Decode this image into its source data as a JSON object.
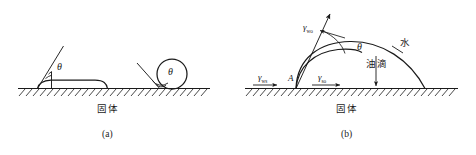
{
  "figure": {
    "title_alt": "Wetting contact angle diagrams",
    "stroke_color": "#1a1a1a",
    "background_color": "#ffffff"
  },
  "panel_a": {
    "caption": "(a)",
    "substrate_label": "固体",
    "angle_label_flat": "θ",
    "angle_label_round": "θ",
    "description": "Left panel: a flattened spreading droplet on a hatched solid surface with a small contact angle theta, and a nearly spherical droplet with a large contact angle theta."
  },
  "panel_b": {
    "caption": "(b)",
    "substrate_label": "固体",
    "point_label": "A",
    "angle_label": "θ",
    "water_label": "水",
    "oil_drop_label": "油滴",
    "gamma_wo": {
      "symbol": "γ",
      "subscript": "wo"
    },
    "gamma_ws": {
      "symbol": "γ",
      "subscript": "ws"
    },
    "gamma_so": {
      "symbol": "γ",
      "subscript": "so"
    },
    "description": "Right panel: an oil droplet under water resting on a hatched solid surface, showing interfacial tension vectors and the contact angle theta at point A."
  }
}
